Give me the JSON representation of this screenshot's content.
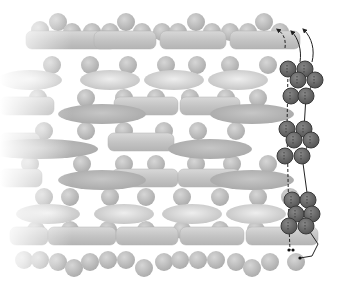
{
  "diagram": {
    "title": "",
    "width": 340,
    "height": 286,
    "colors": {
      "background": "#ffffff",
      "sphere": "#bdbdbd",
      "sphere_dark": "#b3b3b3",
      "rod": "#c8c8c8",
      "ellipse_light": "#d4d4d4",
      "ellipse_dark": "#b5b5b5",
      "chain_sphere": "#6e6e6e",
      "chain_stroke": "#3a3a3a",
      "line": "#222222"
    },
    "spheres": [
      [
        40,
        30
      ],
      [
        58,
        22
      ],
      [
        72,
        32
      ],
      [
        92,
        32
      ],
      [
        110,
        32
      ],
      [
        126,
        22
      ],
      [
        142,
        32
      ],
      [
        162,
        32
      ],
      [
        178,
        32
      ],
      [
        196,
        22
      ],
      [
        212,
        32
      ],
      [
        230,
        32
      ],
      [
        248,
        32
      ],
      [
        264,
        22
      ],
      [
        280,
        32
      ],
      [
        52,
        65
      ],
      [
        90,
        65
      ],
      [
        128,
        65
      ],
      [
        166,
        65
      ],
      [
        197,
        65
      ],
      [
        230,
        65
      ],
      [
        268,
        65
      ],
      [
        38,
        98
      ],
      [
        86,
        98
      ],
      [
        124,
        98
      ],
      [
        156,
        98
      ],
      [
        190,
        98
      ],
      [
        226,
        98
      ],
      [
        258,
        98
      ],
      [
        44,
        131
      ],
      [
        86,
        131
      ],
      [
        124,
        131
      ],
      [
        164,
        131
      ],
      [
        198,
        131
      ],
      [
        236,
        131
      ],
      [
        30,
        164
      ],
      [
        82,
        164
      ],
      [
        124,
        164
      ],
      [
        156,
        164
      ],
      [
        196,
        164
      ],
      [
        232,
        164
      ],
      [
        268,
        164
      ],
      [
        44,
        197
      ],
      [
        70,
        197
      ],
      [
        110,
        197
      ],
      [
        146,
        197
      ],
      [
        182,
        197
      ],
      [
        220,
        197
      ],
      [
        258,
        197
      ],
      [
        290,
        197
      ],
      [
        36,
        230
      ],
      [
        70,
        230
      ],
      [
        108,
        230
      ],
      [
        146,
        230
      ],
      [
        182,
        230
      ],
      [
        220,
        230
      ],
      [
        256,
        230
      ],
      [
        24,
        260
      ],
      [
        40,
        260
      ],
      [
        58,
        262
      ],
      [
        74,
        268
      ],
      [
        90,
        262
      ],
      [
        108,
        260
      ],
      [
        126,
        260
      ],
      [
        144,
        268
      ],
      [
        164,
        262
      ],
      [
        180,
        260
      ],
      [
        198,
        260
      ],
      [
        216,
        260
      ],
      [
        236,
        262
      ],
      [
        252,
        268
      ],
      [
        270,
        262
      ],
      [
        296,
        262
      ]
    ],
    "rods": [
      [
        26,
        40,
        90,
        18
      ],
      [
        94,
        40,
        62,
        18
      ],
      [
        160,
        40,
        66,
        18
      ],
      [
        230,
        40,
        70,
        18
      ],
      [
        0,
        106,
        54,
        18
      ],
      [
        114,
        106,
        64,
        18
      ],
      [
        180,
        106,
        60,
        18
      ],
      [
        0,
        142,
        40,
        18
      ],
      [
        108,
        142,
        66,
        18
      ],
      [
        0,
        178,
        42,
        18
      ],
      [
        112,
        178,
        66,
        18
      ],
      [
        178,
        178,
        62,
        18
      ],
      [
        10,
        236,
        38,
        18
      ],
      [
        48,
        236,
        68,
        18
      ],
      [
        116,
        236,
        62,
        18
      ],
      [
        180,
        236,
        64,
        18
      ],
      [
        246,
        236,
        72,
        18
      ]
    ],
    "ellipses": [
      [
        30,
        80,
        32,
        10,
        "light"
      ],
      [
        110,
        80,
        30,
        10,
        "light"
      ],
      [
        174,
        80,
        30,
        10,
        "light"
      ],
      [
        238,
        80,
        30,
        10,
        "light"
      ],
      [
        102,
        114,
        44,
        10,
        "dark"
      ],
      [
        252,
        114,
        42,
        10,
        "dark"
      ],
      [
        40,
        149,
        58,
        10,
        "dark"
      ],
      [
        210,
        149,
        42,
        10,
        "dark"
      ],
      [
        102,
        180,
        44,
        10,
        "dark"
      ],
      [
        252,
        180,
        42,
        10,
        "dark"
      ],
      [
        48,
        214,
        32,
        10,
        "light"
      ],
      [
        124,
        214,
        30,
        10,
        "light"
      ],
      [
        192,
        214,
        30,
        10,
        "light"
      ],
      [
        256,
        214,
        30,
        10,
        "light"
      ]
    ],
    "chain": [
      [
        288,
        69
      ],
      [
        305,
        69
      ],
      [
        298,
        80
      ],
      [
        315,
        80
      ],
      [
        291,
        96
      ],
      [
        306,
        96
      ],
      [
        287,
        129
      ],
      [
        304,
        129
      ],
      [
        294,
        140
      ],
      [
        311,
        140
      ],
      [
        285,
        156
      ],
      [
        302,
        156
      ],
      [
        292,
        200
      ],
      [
        308,
        200
      ],
      [
        296,
        214
      ],
      [
        312,
        214
      ],
      [
        289,
        226
      ],
      [
        306,
        226
      ]
    ],
    "arrows": [
      {
        "path": "M285,48 C286,40 284,34 278,30",
        "dashed": true
      },
      {
        "path": "M300,62 C302,50 298,38 292,32",
        "dashed": false
      },
      {
        "path": "M312,62 C315,50 312,38 304,30",
        "dashed": false
      }
    ],
    "connectors": [
      {
        "path": "M288,69 L287,129 L289,226 L290,250",
        "dashed": true
      },
      {
        "path": "M305,69 L315,80 L306,96 L304,129 L311,140 L302,156 L308,200 L312,214 L306,226 L318,244 L312,256 L300,258",
        "dashed": false
      }
    ],
    "dots": [
      [
        289,
        250
      ],
      [
        293,
        250
      ],
      [
        300,
        258
      ]
    ],
    "fade_left": true
  }
}
